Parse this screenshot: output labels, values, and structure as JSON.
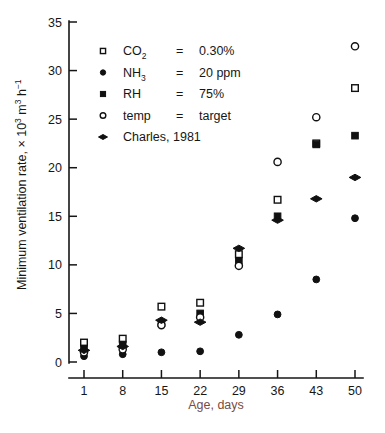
{
  "figure": {
    "background_color": "#ffffff",
    "foreground_color": "#161616",
    "xlabel_color": "#7a4b42"
  },
  "chart_data": {
    "type": "scatter",
    "title": "",
    "xlabel": "Age, days",
    "ylabel": "Minimum ventilation rate, × 10³ m³ h⁻¹",
    "ylabel_parts": {
      "prefix": "Minimum ventilation rate, × 10",
      "exp1": "3",
      "mid": " m",
      "exp2": "3",
      "suffix": " h",
      "exp3": "−1"
    },
    "x": [
      1,
      8,
      15,
      22,
      29,
      36,
      43,
      50
    ],
    "categories": [
      "1",
      "8",
      "15",
      "22",
      "29",
      "36",
      "43",
      "50"
    ],
    "xlim": [
      1,
      50
    ],
    "ylim": [
      0,
      35
    ],
    "yticks": [
      0,
      5,
      10,
      15,
      20,
      25,
      30,
      35
    ],
    "ytick_labels": [
      "0",
      "5",
      "10",
      "15",
      "20",
      "25",
      "30",
      "35"
    ],
    "xticks": [
      1,
      8,
      15,
      22,
      29,
      36,
      43,
      50
    ],
    "grid": false,
    "legend_position": "upper-left-inside",
    "series": [
      {
        "name": "CO2 = 0.30%",
        "marker": "open-square",
        "label_symbol": "CO",
        "label_sub": "2",
        "label_eq": "=",
        "label_value": "0.30%",
        "values": [
          2.0,
          2.4,
          5.7,
          6.1,
          11.1,
          16.7,
          22.5,
          28.2
        ]
      },
      {
        "name": "NH3 = 20 ppm",
        "marker": "filled-circle",
        "label_symbol": "NH",
        "label_sub": "3",
        "label_eq": "=",
        "label_value": "20 ppm",
        "values": [
          0.6,
          0.8,
          1.0,
          1.1,
          2.8,
          4.9,
          8.5,
          14.8
        ]
      },
      {
        "name": "RH = 75%",
        "marker": "filled-square",
        "label_symbol": "RH",
        "label_sub": "",
        "label_eq": "=",
        "label_value": "75%",
        "values": [
          1.4,
          1.8,
          4.0,
          5.0,
          10.4,
          15.0,
          22.4,
          23.3
        ]
      },
      {
        "name": "temp = target",
        "marker": "open-circle",
        "label_symbol": "temp",
        "label_sub": "",
        "label_eq": "=",
        "label_value": "target",
        "values": [
          1.0,
          1.3,
          3.8,
          4.6,
          9.9,
          20.6,
          25.2,
          32.5
        ]
      },
      {
        "name": "Charles, 1981",
        "marker": "diamond",
        "label_symbol": "Charles, 1981",
        "label_sub": "",
        "label_eq": "",
        "label_value": "",
        "values": [
          1.2,
          1.6,
          4.3,
          4.1,
          11.7,
          14.6,
          16.8,
          19.0
        ]
      }
    ]
  },
  "legend": {
    "entries": [
      {
        "marker": "open-square",
        "symbol": "CO",
        "sub": "2",
        "eq": "=",
        "value": "0.30%"
      },
      {
        "marker": "filled-circle",
        "symbol": "NH",
        "sub": "3",
        "eq": "=",
        "value": "20 ppm"
      },
      {
        "marker": "filled-square",
        "symbol": "RH",
        "sub": "",
        "eq": "=",
        "value": "75%"
      },
      {
        "marker": "open-circle",
        "symbol": "temp",
        "sub": "",
        "eq": "=",
        "value": "target"
      },
      {
        "marker": "diamond",
        "symbol": "Charles, 1981",
        "sub": "",
        "eq": "",
        "value": ""
      }
    ]
  }
}
